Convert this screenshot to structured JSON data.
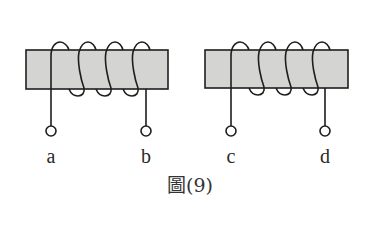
{
  "figure": {
    "caption": "圖(9)",
    "colors": {
      "core_fill": "#d4d4d2",
      "stroke": "#1e1e1e",
      "label": "#2a2a2a",
      "background": "#ffffff"
    }
  },
  "coils": [
    {
      "id": "left",
      "turns": 4,
      "core": {
        "x": 26,
        "y": 50,
        "width": 142,
        "height": 39
      },
      "terminals": [
        {
          "label": "a",
          "x": 51
        },
        {
          "label": "b",
          "x": 146
        }
      ]
    },
    {
      "id": "right",
      "turns": 4,
      "core": {
        "x": 205,
        "y": 50,
        "width": 143,
        "height": 38
      },
      "terminals": [
        {
          "label": "c",
          "x": 231
        },
        {
          "label": "d",
          "x": 325
        }
      ]
    }
  ]
}
